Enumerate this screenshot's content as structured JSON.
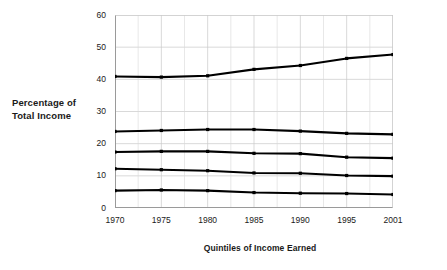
{
  "chart_data": {
    "type": "line",
    "title": "",
    "xlabel": "Quintiles of Income Earned",
    "ylabel": "Percentage of Total Income",
    "x": [
      "1970",
      "1975",
      "1980",
      "1985",
      "1990",
      "1995",
      "2001"
    ],
    "categories": [
      "1970",
      "1975",
      "1980",
      "1985",
      "1990",
      "1995",
      "2001"
    ],
    "xlim": [
      0,
      6
    ],
    "ylim": [
      0,
      60
    ],
    "yticks": [
      0,
      10,
      20,
      30,
      40,
      50,
      60
    ],
    "ytick_labels": [
      "0",
      "10",
      "20",
      "30",
      "40",
      "50",
      "60"
    ],
    "xtick_labels": [
      "1970",
      "1975",
      "1980",
      "1985",
      "1990",
      "1995",
      "2001"
    ],
    "grid": true,
    "grid_minor_x": true,
    "legend": "none",
    "line_color": "#000000",
    "grid_color": "#c8c8c8",
    "axis_color": "#808080",
    "series": [
      {
        "name": "Highest quintile",
        "values": [
          40.9,
          40.7,
          41.1,
          43.1,
          44.3,
          46.5,
          47.7
        ]
      },
      {
        "name": "Fourth quintile",
        "values": [
          23.8,
          24.1,
          24.4,
          24.4,
          23.9,
          23.2,
          22.9
        ]
      },
      {
        "name": "Third quintile",
        "values": [
          17.4,
          17.6,
          17.6,
          17.0,
          16.9,
          15.8,
          15.5
        ]
      },
      {
        "name": "Second quintile",
        "values": [
          12.2,
          11.9,
          11.6,
          10.9,
          10.8,
          10.1,
          9.9
        ]
      },
      {
        "name": "Lowest quintile",
        "values": [
          5.4,
          5.6,
          5.4,
          4.8,
          4.6,
          4.5,
          4.2
        ]
      }
    ]
  },
  "axis_titles": {
    "y_line1": "Percentage of",
    "y_line2": "Total Income",
    "x": "Quintiles of Income Earned"
  }
}
